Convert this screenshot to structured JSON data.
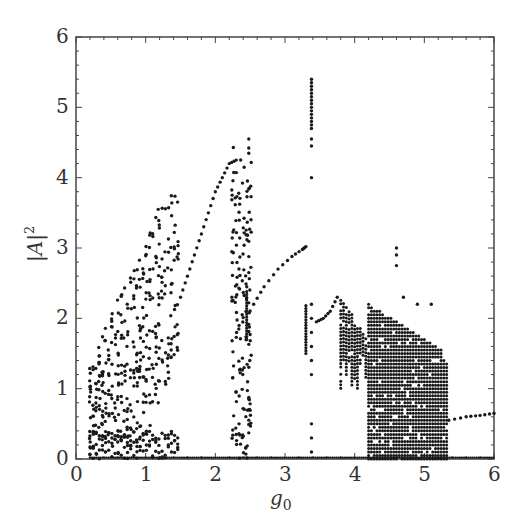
{
  "chart_data": {
    "type": "scatter",
    "title": "",
    "xlabel": "g0",
    "ylabel": "|A|^2",
    "xlim": [
      0,
      6
    ],
    "ylim": [
      0,
      6
    ],
    "xticks": [
      "0",
      "1",
      "2",
      "3",
      "4",
      "5",
      "6"
    ],
    "yticks": [
      "0",
      "1",
      "2",
      "3",
      "4",
      "5",
      "6"
    ],
    "grid": false,
    "legend": null,
    "regions": [
      {
        "name": "chaotic-band-1",
        "x_range": [
          0.2,
          1.5
        ],
        "y_lower_edge": [
          [
            0.2,
            0
          ],
          [
            1.0,
            0.3
          ],
          [
            1.5,
            1.6
          ]
        ],
        "y_upper_edge": [
          [
            0.2,
            1.4
          ],
          [
            0.8,
            2.7
          ],
          [
            1.3,
            3.9
          ],
          [
            1.5,
            3.8
          ]
        ]
      },
      {
        "name": "periodic-branch-rising",
        "points": [
          [
            1.5,
            2.3
          ],
          [
            1.6,
            2.6
          ],
          [
            1.7,
            2.9
          ],
          [
            1.8,
            3.2
          ],
          [
            1.9,
            3.5
          ],
          [
            2.0,
            3.8
          ],
          [
            2.1,
            4.0
          ],
          [
            2.2,
            4.2
          ],
          [
            2.3,
            4.25
          ]
        ]
      },
      {
        "name": "chaotic-window-2",
        "x_range": [
          2.25,
          2.5
        ],
        "y_range": [
          0,
          4.6
        ]
      },
      {
        "name": "periodic-branch-2",
        "points": [
          [
            2.55,
            2.2
          ],
          [
            2.7,
            2.45
          ],
          [
            2.9,
            2.7
          ],
          [
            3.1,
            2.88
          ],
          [
            3.25,
            2.98
          ],
          [
            3.3,
            3.02
          ]
        ]
      },
      {
        "name": "vertical-segment",
        "x": 2.45,
        "y_range": [
          1.7,
          2.4
        ]
      },
      {
        "name": "chaotic-window-3",
        "x": 3.38,
        "y_range": [
          0,
          5.4
        ]
      },
      {
        "name": "vertical-segment-2",
        "x": 3.3,
        "y_range": [
          1.5,
          2.2
        ]
      },
      {
        "name": "periodic-branch-3",
        "points": [
          [
            3.45,
            1.95
          ],
          [
            3.55,
            2.0
          ],
          [
            3.65,
            2.1
          ],
          [
            3.75,
            2.3
          ]
        ]
      },
      {
        "name": "chaotic-band-4",
        "x_range": [
          3.8,
          5.35
        ],
        "y_range": [
          0,
          2.4
        ],
        "outliers": [
          [
            4.6,
            3.0
          ]
        ]
      },
      {
        "name": "periodic-branch-4",
        "points": [
          [
            5.35,
            0.55
          ],
          [
            5.6,
            0.6
          ],
          [
            5.8,
            0.62
          ],
          [
            6.0,
            0.65
          ]
        ]
      },
      {
        "name": "zero-baseline",
        "x_range": [
          0,
          6
        ],
        "y": 0
      }
    ]
  }
}
